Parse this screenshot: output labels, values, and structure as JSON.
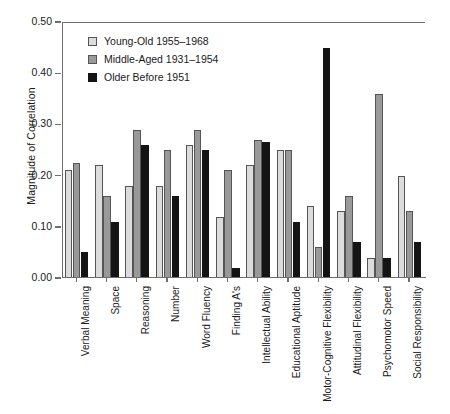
{
  "chart_data": {
    "type": "bar",
    "title": "",
    "xlabel": "",
    "ylabel": "Magnitude of Correlation",
    "ylim": [
      0.0,
      0.5
    ],
    "yticks": [
      "0.00",
      "0.10",
      "0.20",
      "0.30",
      "0.40",
      "0.50"
    ],
    "ytick_values": [
      0.0,
      0.1,
      0.2,
      0.3,
      0.4,
      0.5
    ],
    "grid": false,
    "legend_position": "top-left-inside",
    "categories": [
      "Verbal Meaning",
      "Space",
      "Reasoning",
      "Number",
      "Word Fluency",
      "Finding A's",
      "Intellectual Ability",
      "Educational Aptitude",
      "Motor-Cognitive Flexibility",
      "Attitudinal Flexibility",
      "Psychomotor Speed",
      "Social Responsibility"
    ],
    "series": [
      {
        "name": "Young-Old 1955–1968",
        "color": "#dcdcdc",
        "values": [
          0.21,
          0.22,
          0.18,
          0.18,
          0.26,
          0.12,
          0.22,
          0.25,
          0.14,
          0.13,
          0.04,
          0.2
        ]
      },
      {
        "name": "Middle-Aged 1931–1954",
        "color": "#999999",
        "values": [
          0.225,
          0.16,
          0.29,
          0.25,
          0.29,
          0.21,
          0.27,
          0.25,
          0.06,
          0.16,
          0.36,
          0.13
        ]
      },
      {
        "name": "Older Before 1951",
        "color": "#141414",
        "values": [
          0.05,
          0.11,
          0.26,
          0.16,
          0.25,
          0.02,
          0.265,
          0.11,
          0.45,
          0.07,
          0.04,
          0.07
        ]
      }
    ]
  },
  "legend": {
    "items": [
      {
        "label": "Young-Old 1955–1968",
        "swatch": "light-gray-swatch"
      },
      {
        "label": "Middle-Aged 1931–1954",
        "swatch": "medium-gray-swatch"
      },
      {
        "label": "Older Before 1951",
        "swatch": "black-swatch"
      }
    ]
  },
  "colors": {
    "series_light": "#dcdcdc",
    "series_medium": "#999999",
    "series_dark": "#141414",
    "axis": "#6e6e6e",
    "text": "#1a1a1a",
    "background": "#ffffff"
  }
}
